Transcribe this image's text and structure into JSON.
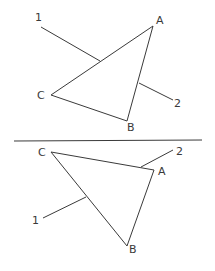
{
  "figures": [
    {
      "name": "top-triangle",
      "vertices": {
        "A": {
          "label": "A",
          "x": 153,
          "y": 26,
          "lx": 156,
          "ly": 24
        },
        "B": {
          "label": "B",
          "x": 127,
          "y": 121,
          "lx": 127,
          "ly": 131
        },
        "C": {
          "label": "C",
          "x": 51,
          "y": 95,
          "lx": 37,
          "ly": 99
        }
      },
      "leaders": [
        {
          "label": "1",
          "x1": 41,
          "y1": 27,
          "x2": 100,
          "y2": 61,
          "lx": 35,
          "ly": 21
        },
        {
          "label": "2",
          "x1": 139,
          "y1": 83,
          "x2": 173,
          "y2": 100,
          "lx": 174,
          "ly": 107
        }
      ]
    },
    {
      "name": "bottom-triangle",
      "vertices": {
        "A": {
          "label": "A",
          "x": 154,
          "y": 170,
          "lx": 158,
          "ly": 175
        },
        "B": {
          "label": "B",
          "x": 127,
          "y": 246,
          "lx": 129,
          "ly": 253
        },
        "C": {
          "label": "C",
          "x": 51,
          "y": 152,
          "lx": 38,
          "ly": 156
        }
      },
      "leaders": [
        {
          "label": "2",
          "x1": 141,
          "y1": 167,
          "x2": 173,
          "y2": 150,
          "lx": 176,
          "ly": 155
        },
        {
          "label": "1",
          "x1": 86,
          "y1": 197,
          "x2": 43,
          "y2": 218,
          "lx": 32,
          "ly": 224
        }
      ]
    }
  ],
  "separator": {
    "x1": 14,
    "y1": 141,
    "x2": 202,
    "y2": 140
  },
  "colors": {
    "stroke": "#3a3a3a",
    "background": "#ffffff"
  }
}
